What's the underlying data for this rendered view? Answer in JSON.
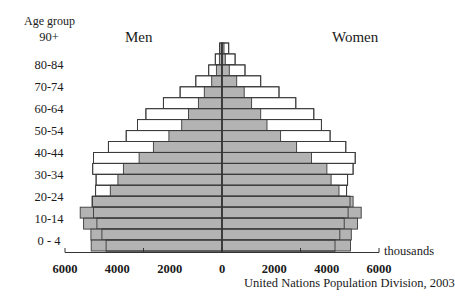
{
  "chart_data": {
    "type": "bar",
    "subtype": "population-pyramid",
    "title": "",
    "left_title": "Men",
    "right_title": "Women",
    "ylabel": "Age group",
    "xlabel": "thousands",
    "source": "United Nations Population Division, 2003",
    "categories": [
      "90+",
      "85-89",
      "80-84",
      "75-79",
      "70-74",
      "65-69",
      "60-64",
      "55-59",
      "50-54",
      "45-49",
      "40-44",
      "35-39",
      "30-34",
      "25-29",
      "20-24",
      "15-19",
      "10-14",
      "5-9",
      "0-4"
    ],
    "visible_age_labels": [
      "90+",
      "80-84",
      "70-74",
      "60-64",
      "50-54",
      "40-44",
      "30-34",
      "20-24",
      "10-14",
      "0 - 4"
    ],
    "x_tick_labels": [
      "6000",
      "4000",
      "2000",
      "0",
      "2000",
      "4000",
      "6000"
    ],
    "xlim": [
      -6000,
      6000
    ],
    "grid": false,
    "series": [
      {
        "name": "Men (shaded)",
        "side": "left",
        "fill": "#b3b3b3",
        "values": [
          40,
          100,
          215,
          395,
          675,
          900,
          1280,
          1540,
          2030,
          2620,
          3170,
          3770,
          3980,
          4270,
          4970,
          5420,
          5290,
          5010,
          5000
        ]
      },
      {
        "name": "Men (outline)",
        "side": "left",
        "fill": "#ffffff",
        "values": [
          90,
          255,
          510,
          1000,
          1600,
          2240,
          2910,
          3230,
          3660,
          4340,
          4910,
          4940,
          4810,
          4830,
          4950,
          4910,
          4780,
          4590,
          4430
        ]
      },
      {
        "name": "Women (shaded)",
        "side": "right",
        "fill": "#b3b3b3",
        "values": [
          75,
          125,
          280,
          560,
          850,
          1130,
          1480,
          1720,
          2240,
          2850,
          3420,
          4010,
          4170,
          4470,
          5010,
          5320,
          5180,
          4940,
          4910
        ]
      },
      {
        "name": "Women (outline)",
        "side": "right",
        "fill": "#ffffff",
        "values": [
          255,
          500,
          880,
          1480,
          2180,
          2820,
          3510,
          3800,
          4130,
          4730,
          5090,
          5010,
          4800,
          4760,
          4890,
          4820,
          4670,
          4500,
          4320
        ]
      }
    ]
  },
  "labels": {
    "age_group": "Age group",
    "men": "Men",
    "women": "Women",
    "units": "thousands",
    "source": "United Nations Population Division, 2003"
  }
}
